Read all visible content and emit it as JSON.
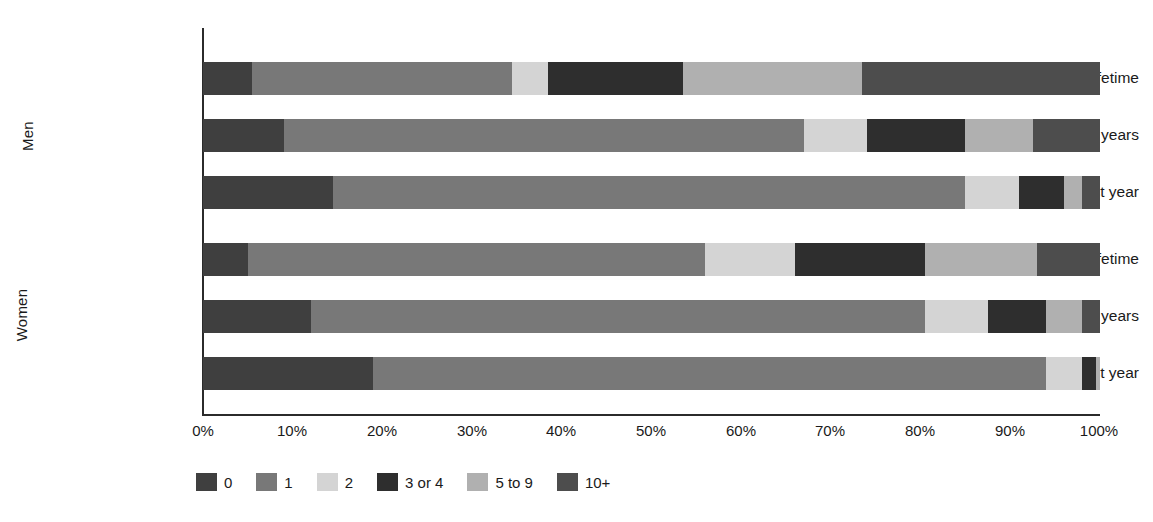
{
  "chart_data": {
    "type": "bar",
    "orientation": "horizontal",
    "stacked": true,
    "stack_mode": "percent",
    "title": "",
    "subtitle": "",
    "xlabel": "",
    "ylabel": "",
    "xlim": [
      0,
      100
    ],
    "xticks": [
      0,
      10,
      20,
      30,
      40,
      50,
      60,
      70,
      80,
      90,
      100
    ],
    "xtick_labels": [
      "0%",
      "10%",
      "20%",
      "30%",
      "40%",
      "50%",
      "60%",
      "70%",
      "80%",
      "90%",
      "100%"
    ],
    "grid": false,
    "legend_position": "bottom-left",
    "legend_entries": [
      "0",
      "1",
      "2",
      "3 or 4",
      "5 to 9",
      "10+"
    ],
    "series": [
      {
        "name": "0",
        "color": "#3f3f3f",
        "values": [
          5.5,
          9.0,
          14.5,
          5.0,
          12.0,
          19.0
        ]
      },
      {
        "name": "1",
        "color": "#787878",
        "values": [
          29.0,
          58.0,
          70.5,
          51.0,
          68.5,
          75.0
        ]
      },
      {
        "name": "2",
        "color": "#d4d4d4",
        "values": [
          4.0,
          7.0,
          6.0,
          10.0,
          7.0,
          4.0
        ]
      },
      {
        "name": "3 or 4",
        "color": "#2e2e2e",
        "values": [
          15.0,
          11.0,
          5.0,
          14.5,
          6.5,
          1.5
        ]
      },
      {
        "name": "5 to 9",
        "color": "#b0b0b0",
        "values": [
          20.0,
          7.5,
          2.0,
          12.5,
          4.0,
          0.5
        ]
      },
      {
        "name": "10+",
        "color": "#4d4d4d",
        "values": [
          26.5,
          7.5,
          2.0,
          7.0,
          2.0,
          0.0
        ]
      }
    ],
    "groups": [
      {
        "label": "Men",
        "categories": [
          "Lifetime",
          "Last 5 years",
          "Last year"
        ]
      },
      {
        "label": "Women",
        "categories": [
          "Lifetime",
          "Last 5 years",
          "Last year"
        ]
      }
    ],
    "categories": [
      "Lifetime",
      "Last 5 years",
      "Last year",
      "Lifetime",
      "Last 5 years",
      "Last year"
    ],
    "rows": [
      {
        "group": "Men",
        "category": "Lifetime",
        "values": [
          5.5,
          29.0,
          4.0,
          15.0,
          20.0,
          26.5
        ]
      },
      {
        "group": "Men",
        "category": "Last 5 years",
        "values": [
          9.0,
          58.0,
          7.0,
          11.0,
          7.5,
          7.5
        ]
      },
      {
        "group": "Men",
        "category": "Last year",
        "values": [
          14.5,
          70.5,
          6.0,
          5.0,
          2.0,
          2.0
        ]
      },
      {
        "group": "Women",
        "category": "Lifetime",
        "values": [
          5.0,
          51.0,
          10.0,
          14.5,
          12.5,
          7.0
        ]
      },
      {
        "group": "Women",
        "category": "Last 5 years",
        "values": [
          12.0,
          68.5,
          7.0,
          6.5,
          4.0,
          2.0
        ]
      },
      {
        "group": "Women",
        "category": "Last year",
        "values": [
          19.0,
          75.0,
          4.0,
          1.5,
          0.5,
          0.0
        ]
      }
    ]
  },
  "axis": {
    "tick_0": "0%",
    "tick_1": "10%",
    "tick_2": "20%",
    "tick_3": "30%",
    "tick_4": "40%",
    "tick_5": "50%",
    "tick_6": "60%",
    "tick_7": "70%",
    "tick_8": "80%",
    "tick_9": "90%",
    "tick_10": "100%"
  },
  "groups": {
    "men": "Men",
    "women": "Women"
  },
  "row_labels": {
    "men_lifetime": "Lifetime",
    "men_last5": "Last 5 years",
    "men_lastyear": "Last year",
    "women_lifetime": "Lifetime",
    "women_last5": "Last 5 years",
    "women_lastyear": "Last year"
  },
  "legend": {
    "items": [
      {
        "label": "0",
        "color": "#3f3f3f"
      },
      {
        "label": "1",
        "color": "#787878"
      },
      {
        "label": "2",
        "color": "#d4d4d4"
      },
      {
        "label": "3 or 4",
        "color": "#2e2e2e"
      },
      {
        "label": "5 to 9",
        "color": "#b0b0b0"
      },
      {
        "label": "10+",
        "color": "#4d4d4d"
      }
    ]
  },
  "colors": {
    "axis": "#2b2b2b",
    "text": "#1a1a1a",
    "background": "#ffffff"
  }
}
